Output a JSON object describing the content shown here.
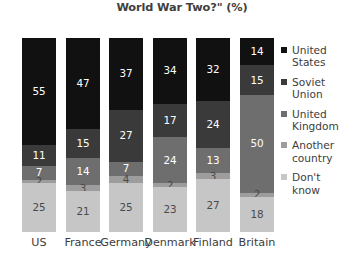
{
  "title": {
    "lines": [
      "you say contributed most to the defeat of Germany in",
      "World War Two?\" (%)"
    ]
  },
  "chart_data": {
    "type": "bar",
    "subtype": "stacked-bar-100",
    "xlabel": "",
    "ylabel": "",
    "ylim": [
      0,
      100
    ],
    "grid": false,
    "legend_position": "right",
    "categories": [
      "US",
      "France",
      "Germany",
      "Denmark",
      "Finland",
      "Britain"
    ],
    "series": [
      {
        "name": "United States",
        "color": "#111111",
        "values": [
          55,
          47,
          37,
          34,
          32,
          14
        ]
      },
      {
        "name": "Soviet Union",
        "color": "#3a3a3a",
        "values": [
          11,
          15,
          27,
          17,
          24,
          15
        ]
      },
      {
        "name": "United Kingdom",
        "color": "#6e6e6e",
        "values": [
          7,
          14,
          7,
          24,
          13,
          50
        ]
      },
      {
        "name": "Another country",
        "color": "#9d9d9d",
        "values": [
          2,
          3,
          4,
          2,
          3,
          2
        ]
      },
      {
        "name": "Don't know",
        "color": "#c6c6c6",
        "values": [
          25,
          21,
          25,
          23,
          27,
          18
        ]
      }
    ]
  },
  "legend": {
    "items": [
      {
        "label_lines": [
          "United",
          "States"
        ]
      },
      {
        "label_lines": [
          "Soviet",
          "Union"
        ]
      },
      {
        "label_lines": [
          "United",
          "Kingdom"
        ]
      },
      {
        "label_lines": [
          "Another",
          "country"
        ]
      },
      {
        "label_lines": [
          "Don't",
          "know"
        ]
      }
    ]
  }
}
